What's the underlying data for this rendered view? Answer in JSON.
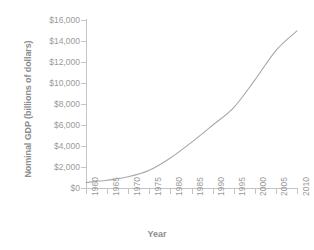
{
  "chart_data": {
    "type": "line",
    "title": "",
    "xlabel": "Year",
    "ylabel": "Nominal GDP (billions of dollars)",
    "xlim": [
      1960,
      2010
    ],
    "ylim": [
      0,
      16000
    ],
    "grid": false,
    "legend": false,
    "legend_position": "none",
    "line_color": "#a8a8a8",
    "x_tick_labels": [
      "1960",
      "1965",
      "1970",
      "1975",
      "1980",
      "1985",
      "1990",
      "1995",
      "2000",
      "2005",
      "2010"
    ],
    "x_ticks": [
      1960,
      1965,
      1970,
      1975,
      1980,
      1985,
      1990,
      1995,
      2000,
      2005,
      2010
    ],
    "y_tick_labels": [
      "$0",
      "$2,000",
      "$4,000",
      "$6,000",
      "$8,000",
      "$10,000",
      "$12,000",
      "$14,000",
      "$16,000"
    ],
    "y_ticks": [
      0,
      2000,
      4000,
      6000,
      8000,
      10000,
      12000,
      14000,
      16000
    ],
    "series": [
      {
        "name": "Nominal GDP",
        "x": [
          1960,
          1965,
          1970,
          1975,
          1980,
          1985,
          1990,
          1995,
          2000,
          2005,
          2010
        ],
        "values": [
          520,
          740,
          1070,
          1690,
          2860,
          4350,
          5980,
          7660,
          10280,
          13090,
          14960
        ]
      }
    ]
  },
  "axes": {
    "ylabel": "Nominal GDP (billions of dollars)",
    "xlabel": "Year"
  }
}
